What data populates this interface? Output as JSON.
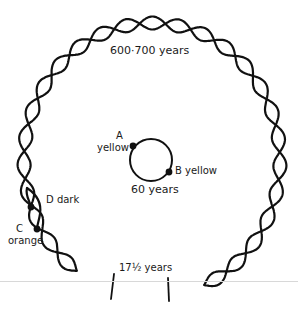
{
  "diagram": {
    "type": "life-cycle-helix",
    "colors": {
      "ink": "#111111",
      "background": "#ffffff",
      "rule": "#d8d8d8"
    },
    "outer_helix": {
      "label": "600·700 years"
    },
    "inner_circle": {
      "label": "60 years"
    },
    "segment": {
      "label": "17½ years"
    },
    "points": {
      "A": {
        "letter": "A",
        "color_label": "yellow"
      },
      "B": {
        "letter": "B",
        "color_label": "yellow"
      },
      "C": {
        "letter": "C",
        "color_label": "orange"
      },
      "D": {
        "letter": "D",
        "color_label": "dark"
      }
    }
  },
  "labels": {
    "outer": "600·700 years",
    "inner": "60 years",
    "segment": "17½ years",
    "a_letter": "A",
    "a_color": "yellow",
    "b_full": "B yellow",
    "c_letter": "C",
    "c_color": "orange",
    "d_full": "D dark"
  }
}
